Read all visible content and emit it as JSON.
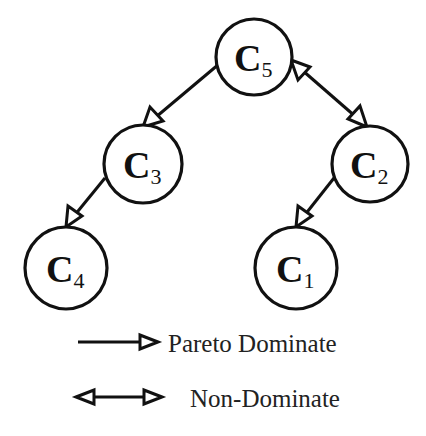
{
  "diagram": {
    "nodes": [
      {
        "id": "C5",
        "letter": "C",
        "sub": "5",
        "cx": 254,
        "cy": 57,
        "r": 38
      },
      {
        "id": "C3",
        "letter": "C",
        "sub": "3",
        "cx": 143,
        "cy": 164,
        "r": 39
      },
      {
        "id": "C2",
        "letter": "C",
        "sub": "2",
        "cx": 370,
        "cy": 164,
        "r": 38
      },
      {
        "id": "C4",
        "letter": "C",
        "sub": "4",
        "cx": 66,
        "cy": 268,
        "r": 41
      },
      {
        "id": "C1",
        "letter": "C",
        "sub": "1",
        "cx": 296,
        "cy": 268,
        "r": 41
      }
    ],
    "edges": [
      {
        "from": "C5",
        "to": "C3",
        "type": "pareto-dominate"
      },
      {
        "from": "C5",
        "to": "C2",
        "type": "non-dominate"
      },
      {
        "from": "C3",
        "to": "C4",
        "type": "pareto-dominate"
      },
      {
        "from": "C2",
        "to": "C1",
        "type": "pareto-dominate"
      }
    ]
  },
  "legend": {
    "pareto_label": "Pareto Dominate",
    "non_dominate_label": "Non-Dominate"
  },
  "labels": {
    "c5_letter": "C",
    "c5_sub": "5",
    "c3_letter": "C",
    "c3_sub": "3",
    "c2_letter": "C",
    "c2_sub": "2",
    "c4_letter": "C",
    "c4_sub": "4",
    "c1_letter": "C",
    "c1_sub": "1"
  },
  "colors": {
    "stroke": "#111111",
    "background": "#ffffff"
  }
}
